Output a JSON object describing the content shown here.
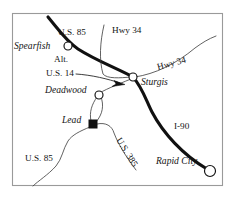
{
  "figure": {
    "kind": "reference-map",
    "region": "Black Hills, South Dakota",
    "frame": {
      "x": 12,
      "y": 13,
      "width": 211,
      "height": 173,
      "stroke_color": "#9a9a9a"
    },
    "background_color": "#ffffff",
    "ink_color": "#111111"
  },
  "cities": [
    {
      "id": "spearfish",
      "label": "Spearfish",
      "marker": "open-circle",
      "marker_x": 68,
      "marker_y": 46,
      "label_x": 14,
      "label_y": 49
    },
    {
      "id": "deadwood",
      "label": "Deadwood",
      "marker": "open-circle",
      "marker_x": 99,
      "marker_y": 95,
      "label_x": 45,
      "label_y": 93
    },
    {
      "id": "lead",
      "label": "Lead",
      "marker": "filled-square",
      "marker_x": 93,
      "marker_y": 124,
      "label_x": 62,
      "label_y": 123
    },
    {
      "id": "sturgis",
      "label": "Sturgis",
      "marker": "open-circle",
      "marker_x": 133,
      "marker_y": 77,
      "label_x": 141,
      "label_y": 85
    },
    {
      "id": "rapid-city",
      "label": "Rapid City",
      "marker": "open-circle",
      "marker_x": 210,
      "marker_y": 171,
      "label_x": 156,
      "label_y": 164
    }
  ],
  "route_labels": [
    {
      "id": "us-85-north",
      "text": "U.S. 85",
      "x": 58,
      "y": 35,
      "rotation": 0
    },
    {
      "id": "hwy-34-north",
      "text": "Hwy 34",
      "x": 112,
      "y": 33,
      "rotation": 0
    },
    {
      "id": "alt",
      "text": "Alt.",
      "x": 54,
      "y": 62,
      "rotation": 0
    },
    {
      "id": "us-14",
      "text": "U.S. 14",
      "x": 46,
      "y": 76,
      "rotation": 0
    },
    {
      "id": "hwy-34-east",
      "text": "Hwy 34",
      "x": 158,
      "y": 70,
      "rotation": -15
    },
    {
      "id": "i-90",
      "text": "I-90",
      "x": 174,
      "y": 129,
      "rotation": 0
    },
    {
      "id": "us-385",
      "text": "U.S. 385",
      "x": 116,
      "y": 140,
      "rotation": 58
    },
    {
      "id": "us-85-south",
      "text": "U.S. 85",
      "x": 25,
      "y": 161,
      "rotation": 0
    }
  ],
  "roads": [
    {
      "id": "us-85-i90-corridor",
      "name": "U.S. 85 / I-90 main corridor",
      "weight": "major",
      "path": "M 48 17 C 58 29 66 41 78 49 C 95 60 116 68 133 77 C 142 87 146 100 152 112 C 163 133 183 155 207 169"
    },
    {
      "id": "hwy-34-north-branch",
      "name": "Hwy 34 north branch",
      "weight": "thin",
      "path": "M 104 25 C 100 42 99 60 103 74 C 107 79 120 78 131 77"
    },
    {
      "id": "hwy-34-east-branch",
      "name": "Hwy 34 east branch",
      "weight": "thin",
      "path": "M 135 77 C 155 74 176 64 195 48 C 202 43 208 39 216 36"
    },
    {
      "id": "alt-us-14",
      "name": "Alt. U.S. 14 Deadwood to Sturgis",
      "weight": "thin",
      "path": "M 96 95 C 104 90 116 85 131 79"
    },
    {
      "id": "deadwood-lead-loop-west",
      "name": "Deadwood to Lead west loop",
      "weight": "thin",
      "path": "M 97 97 C 92 104 89 112 91 121"
    },
    {
      "id": "deadwood-lead-loop-east",
      "name": "Deadwood to Lead east loop",
      "weight": "thin",
      "path": "M 101 97 C 104 105 103 114 96 122"
    },
    {
      "id": "us-385-south",
      "name": "U.S. 385 south of Lead",
      "weight": "thin",
      "path": "M 97 124 C 106 122 112 126 114 133 C 119 146 127 158 136 170"
    },
    {
      "id": "us-85-southwest",
      "name": "U.S. 85 southwest",
      "weight": "thin",
      "path": "M 90 127 C 80 131 72 135 68 141 C 63 149 62 159 56 166 C 48 175 38 181 33 186"
    }
  ],
  "annotations": [
    {
      "id": "alt-us-14-leader",
      "type": "leader-with-arrow",
      "path": "M 76 74 C 92 75 108 79 120 83",
      "arrow_tip_x": 124,
      "arrow_tip_y": 84
    }
  ]
}
